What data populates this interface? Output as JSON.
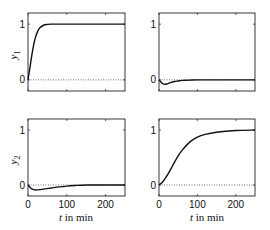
{
  "chart_data": [
    {
      "type": "line",
      "panel": "top-left",
      "ylabel": "y_1",
      "xlabel": "",
      "xlim": [
        0,
        250
      ],
      "ylim": [
        -0.2,
        1.2
      ],
      "yticks": [
        "0",
        "1"
      ],
      "xticks": [],
      "reference_line": {
        "y": 0,
        "style": "dotted"
      },
      "series": [
        {
          "name": "y1 response",
          "x": [
            0,
            5,
            10,
            15,
            20,
            25,
            30,
            40,
            50,
            60,
            80,
            100,
            150,
            200,
            250
          ],
          "values": [
            0,
            0.22,
            0.45,
            0.64,
            0.78,
            0.87,
            0.93,
            0.98,
            0.995,
            1.0,
            1.0,
            1.0,
            1.0,
            1.0,
            1.0
          ]
        }
      ]
    },
    {
      "type": "line",
      "panel": "top-right",
      "ylabel": "",
      "xlabel": "",
      "xlim": [
        0,
        250
      ],
      "ylim": [
        -0.2,
        1.2
      ],
      "yticks": [
        "0",
        "1"
      ],
      "xticks": [],
      "reference_line": {
        "y": 0,
        "style": "dotted"
      },
      "series": [
        {
          "name": "y1 response (input 2)",
          "x": [
            0,
            5,
            10,
            15,
            20,
            30,
            40,
            50,
            60,
            80,
            100,
            150,
            200,
            250
          ],
          "values": [
            0,
            -0.04,
            -0.07,
            -0.08,
            -0.075,
            -0.05,
            -0.03,
            -0.02,
            -0.01,
            -0.005,
            0,
            0,
            0,
            0
          ]
        }
      ]
    },
    {
      "type": "line",
      "panel": "bottom-left",
      "ylabel": "y_2",
      "xlabel": "t  in min",
      "xlim": [
        0,
        250
      ],
      "ylim": [
        -0.2,
        1.2
      ],
      "yticks": [
        "0",
        "1"
      ],
      "xticks": [
        "0",
        "100",
        "200"
      ],
      "reference_line": {
        "y": 0,
        "style": "dotted"
      },
      "series": [
        {
          "name": "y2 response (input 1)",
          "x": [
            0,
            5,
            10,
            15,
            20,
            30,
            40,
            60,
            80,
            100,
            120,
            150,
            200,
            250
          ],
          "values": [
            0,
            -0.04,
            -0.07,
            -0.085,
            -0.09,
            -0.085,
            -0.075,
            -0.055,
            -0.035,
            -0.02,
            -0.01,
            0,
            0,
            0
          ]
        }
      ]
    },
    {
      "type": "line",
      "panel": "bottom-right",
      "ylabel": "",
      "xlabel": "t  in min",
      "xlim": [
        0,
        250
      ],
      "ylim": [
        -0.2,
        1.2
      ],
      "yticks": [
        "0",
        "1"
      ],
      "xticks": [
        "0",
        "100",
        "200"
      ],
      "reference_line": {
        "y": 0,
        "style": "dotted"
      },
      "series": [
        {
          "name": "y2 response",
          "x": [
            0,
            10,
            20,
            30,
            40,
            50,
            60,
            80,
            100,
            120,
            150,
            200,
            250
          ],
          "values": [
            0,
            0.06,
            0.16,
            0.28,
            0.41,
            0.53,
            0.63,
            0.78,
            0.87,
            0.92,
            0.96,
            0.99,
            1.0
          ]
        }
      ]
    }
  ],
  "labels": {
    "y1": "y",
    "y1_sub": "1",
    "y2": "y",
    "y2_sub": "2",
    "xlabel_t": "t",
    "xlabel_rest": " in min",
    "tick_0": "0",
    "tick_1": "1",
    "tick_100": "100",
    "tick_200": "200"
  }
}
